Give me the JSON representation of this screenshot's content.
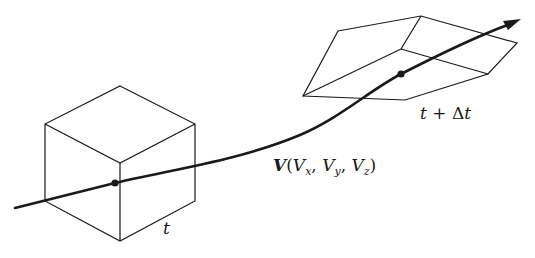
{
  "diagram": {
    "type": "fluid-element-pathline",
    "labels": {
      "time_start": "t",
      "time_end_t": "t",
      "time_end_plus": " + Δ",
      "time_end_t2": "t",
      "velocity_symbol": "V",
      "velocity_open": "(",
      "vx": "V",
      "vx_sub": "x",
      "sep1": ", ",
      "vy": "V",
      "vy_sub": "y",
      "sep2": ", ",
      "vz": "V",
      "vz_sub": "z",
      "velocity_close": ")"
    },
    "elements": [
      {
        "name": "cube-element",
        "description": "Fluid element at time t (cube)"
      },
      {
        "name": "deformed-element",
        "description": "Deformed fluid element at time t + Δt"
      },
      {
        "name": "pathline",
        "description": "Trajectory curve with arrow"
      }
    ],
    "colors": {
      "stroke": "#1a1a1a",
      "background": "#ffffff"
    }
  }
}
